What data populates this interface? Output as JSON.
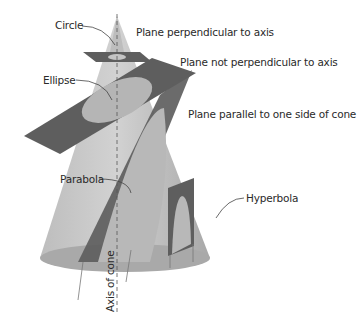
{
  "figure": {
    "colors": {
      "cone_light": "#c9c9c9",
      "cone_dark": "#9a9a9a",
      "plane": "#5e5e5e",
      "section": "#b5b5b5",
      "text": "#2a2a2a",
      "background": "#ffffff"
    }
  },
  "labels": {
    "circle": "Circle",
    "plane_perpendicular": "Plane perpendicular to axis",
    "ellipse": "Ellipse",
    "plane_not_perpendicular": "Plane not perpendicular to axis",
    "plane_parallel": "Plane parallel to one side of cone",
    "parabola": "Parabola",
    "hyperbola": "Hyperbola",
    "axis": "Axis of cone"
  }
}
